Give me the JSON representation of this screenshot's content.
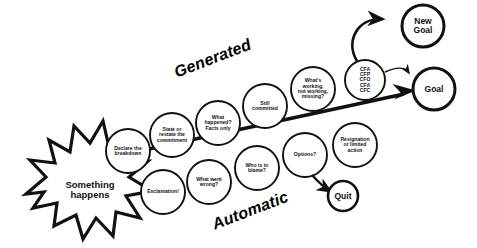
{
  "diagram": {
    "colors": {
      "stroke": "#111111",
      "fill": "#ffffff",
      "text": "#111111",
      "background": "#ffffff"
    },
    "axis_labels": [
      {
        "name": "generated",
        "text": "Generated",
        "rotation": -21,
        "font_size": 16
      },
      {
        "name": "automatic",
        "text": "Automatic",
        "rotation": -21,
        "font_size": 16
      }
    ],
    "trigger": {
      "name": "something-happens",
      "text": "Something\nhappens",
      "shape": "starburst",
      "font_size": 9.5
    },
    "generated_path": [
      {
        "id": "declare-the-breakdown",
        "text": "Declare the\nbreakdown",
        "cx": 128,
        "cy": 151,
        "r": 22,
        "font_size": 5.1
      },
      {
        "id": "state-or-restate-the-commitment",
        "text": "State or\nrestate the\ncommitment",
        "cx": 172,
        "cy": 135,
        "r": 22,
        "font_size": 5.1
      },
      {
        "id": "what-happened-facts-only",
        "text": "What\nhappened?\nFacts only",
        "cx": 218,
        "cy": 123,
        "r": 22,
        "font_size": 5.1
      },
      {
        "id": "still-committed",
        "text": "Still\ncommitted",
        "cx": 265,
        "cy": 106,
        "r": 22,
        "font_size": 5.1
      },
      {
        "id": "whats-working-not-working-missing",
        "text": "What's\nworking,\nnot working,\nmissing?",
        "cx": 313,
        "cy": 89,
        "r": 22,
        "font_size": 5.1
      },
      {
        "id": "conversations",
        "text": "CFA\nCFP\nCFO\nCFA\nCFC",
        "cx": 365,
        "cy": 80,
        "r": 20,
        "font_size": 5.1
      }
    ],
    "automatic_path": [
      {
        "id": "exclamation",
        "text": "Exclamation!",
        "cx": 163,
        "cy": 192,
        "r": 22,
        "font_size": 5.1
      },
      {
        "id": "what-went-wrong",
        "text": "What went\nwrong?",
        "cx": 209,
        "cy": 182,
        "r": 22,
        "font_size": 5.1
      },
      {
        "id": "who-is-to-blame",
        "text": "Who is to\nblame?",
        "cx": 257,
        "cy": 168,
        "r": 22,
        "font_size": 5.1
      },
      {
        "id": "options",
        "text": "Options?",
        "cx": 305,
        "cy": 155,
        "r": 22,
        "font_size": 5.1
      },
      {
        "id": "resignation-or-limited-action",
        "text": "Resignation\nor limited\naction",
        "cx": 355,
        "cy": 145,
        "r": 22,
        "font_size": 5.1
      }
    ],
    "outcomes": [
      {
        "id": "new-goal",
        "text": "New\nGoal",
        "cx": 423,
        "cy": 26,
        "r": 21,
        "font_size": 8.5
      },
      {
        "id": "goal",
        "text": "Goal",
        "cx": 434,
        "cy": 89,
        "r": 21,
        "font_size": 8.5
      },
      {
        "id": "quit",
        "text": "Quit",
        "cx": 343,
        "cy": 196,
        "r": 15,
        "font_size": 8.5
      }
    ],
    "connectors": [
      {
        "id": "main-progress-arrow",
        "from": "something-happens",
        "to": "goal",
        "style": "thick-straight"
      },
      {
        "id": "conversations-to-new-goal",
        "from": "conversations",
        "to": "new-goal",
        "style": "curved"
      },
      {
        "id": "conversations-to-goal",
        "from": "conversations",
        "to": "goal",
        "style": "curved-thin"
      },
      {
        "id": "options-to-quit",
        "from": "options",
        "to": "quit",
        "style": "curved"
      }
    ]
  }
}
